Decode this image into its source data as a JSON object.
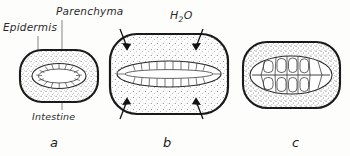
{
  "figure": {
    "title_labels": {
      "parenchyma": "Parenchyma",
      "epidermis": "Epidermis",
      "intestine": "Intestine",
      "water_formula": "H",
      "water_subscript": "2",
      "water_suffix": "O"
    },
    "panels": [
      {
        "caption": "a",
        "state": "normal",
        "body_width": 70,
        "body_height": 46,
        "intestine_shape": "narrow-oval",
        "intestine_cells": 17,
        "arrows": 0
      },
      {
        "caption": "b",
        "state": "swollen-water-uptake",
        "body_width": 112,
        "body_height": 76,
        "intestine_shape": "flattened-stretched",
        "intestine_cells": 22,
        "arrows": 4
      },
      {
        "caption": "c",
        "state": "contracted",
        "body_width": 92,
        "body_height": 62,
        "intestine_shape": "rounded-large-cells",
        "intestine_cells": 13,
        "arrows": 0
      }
    ],
    "colors": {
      "ink": "#1d1d1d",
      "stipple": "#5a5a5a",
      "leader": "#6b6b6b",
      "paper": "#fdfdfc"
    }
  }
}
